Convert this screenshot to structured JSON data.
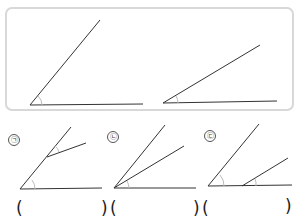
{
  "reference_box": {
    "angles": [
      {
        "name": "reference-angle-large",
        "vertex": [
          30,
          105
        ],
        "ray1": [
          100,
          20
        ],
        "ray2": [
          143,
          104
        ]
      },
      {
        "name": "reference-angle-small",
        "vertex": [
          163,
          103
        ],
        "ray1": [
          260,
          45
        ],
        "ray2": [
          277,
          101
        ]
      }
    ],
    "border_color": "#d8d8d8"
  },
  "options": [
    {
      "label": "㉠",
      "label_pos": [
        8,
        134
      ],
      "answer_open": "(",
      "answer_close": ")"
    },
    {
      "label": "㉡",
      "label_pos": [
        107,
        131
      ],
      "answer_open": "(",
      "answer_close": ")"
    },
    {
      "label": "㉢",
      "label_pos": [
        204,
        130
      ],
      "answer_open": "(",
      "answer_close": ")"
    }
  ],
  "colors": {
    "line": "#333333",
    "arc": "#bbbbbb"
  }
}
